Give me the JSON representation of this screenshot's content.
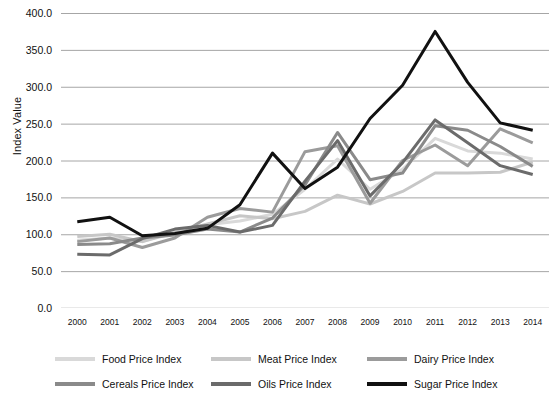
{
  "chart_data": {
    "type": "line",
    "title": "",
    "xlabel": "",
    "ylabel": "Index Value",
    "categories": [
      2000,
      2001,
      2002,
      2003,
      2004,
      2005,
      2006,
      2007,
      2008,
      2009,
      2010,
      2011,
      2012,
      2013,
      2014
    ],
    "x_tick_labels": [
      "2000",
      "2001",
      "2002",
      "2003",
      "2004",
      "2005",
      "2006",
      "2007",
      "2008",
      "2009",
      "2010",
      "2011",
      "2012",
      "2013",
      "2014"
    ],
    "y_tick_labels": [
      "400.0",
      "350.0",
      "300.0",
      "250.0",
      "200.0",
      "150.0",
      "100.0",
      "50.0",
      "0.0"
    ],
    "y_ticks": [
      400,
      350,
      300,
      250,
      200,
      150,
      100,
      50,
      0
    ],
    "ylim": [
      0,
      400
    ],
    "grid": "horizontal",
    "legend_position": "bottom",
    "legend_columns": 3,
    "series": [
      {
        "name": "Food Price Index",
        "color": "#d9d9d9",
        "values": [
          92,
          95,
          90,
          104,
          113,
          118,
          127,
          161,
          202,
          161,
          188,
          230,
          213,
          210,
          202
        ]
      },
      {
        "name": "Meat Price Index",
        "color": "#c7c7c7",
        "values": [
          97,
          100,
          90,
          102,
          114,
          125,
          121,
          131,
          153,
          141,
          158,
          183,
          183,
          184,
          198
        ]
      },
      {
        "name": "Dairy Price Index",
        "color": "#9b9b9b",
        "values": [
          90,
          95,
          82,
          95,
          123,
          135,
          130,
          212,
          220,
          142,
          200,
          221,
          193,
          243,
          224
        ]
      },
      {
        "name": "Cereals Price Index",
        "color": "#8a8a8a",
        "values": [
          86,
          87,
          95,
          99,
          107,
          103,
          122,
          167,
          238,
          174,
          183,
          247,
          241,
          219,
          192
        ]
      },
      {
        "name": "Oils Price Index",
        "color": "#6b6b6b",
        "values": [
          73,
          72,
          94,
          107,
          112,
          103,
          112,
          172,
          227,
          152,
          197,
          255,
          224,
          193,
          181
        ]
      },
      {
        "name": "Sugar Price Index",
        "color": "#111111",
        "values": [
          117,
          123,
          98,
          101,
          108,
          140,
          210,
          162,
          191,
          257,
          302,
          375,
          306,
          251,
          241
        ]
      }
    ]
  },
  "legend": {
    "items": [
      {
        "label": "Food Price Index",
        "color": "#d9d9d9"
      },
      {
        "label": "Meat Price Index",
        "color": "#c7c7c7"
      },
      {
        "label": "Dairy Price Index",
        "color": "#9b9b9b"
      },
      {
        "label": "Cereals Price Index",
        "color": "#8a8a8a"
      },
      {
        "label": "Oils Price Index",
        "color": "#6b6b6b"
      },
      {
        "label": "Sugar Price Index",
        "color": "#111111"
      }
    ]
  },
  "style": {
    "gridline_color": "#a6a6a6",
    "background": "#ffffff",
    "line_width": 3
  }
}
